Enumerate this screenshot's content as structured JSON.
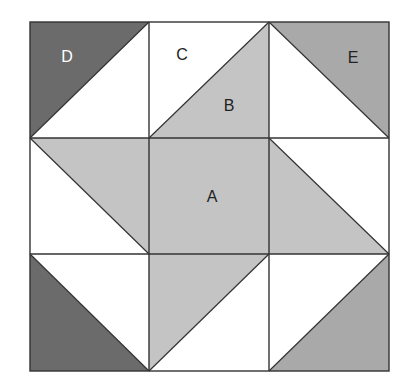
{
  "colors": {
    "dark": "#6b6b6b",
    "light": "#c4c4c4",
    "medium": "#a9a9a9",
    "white": "#ffffff",
    "line": "#333333"
  },
  "grid": {
    "x": [
      30,
      149,
      269,
      389
    ],
    "y": [
      22,
      138,
      254,
      371
    ]
  },
  "labels": {
    "A": "A",
    "B": "B",
    "C": "C",
    "D": "D",
    "E": "E"
  }
}
